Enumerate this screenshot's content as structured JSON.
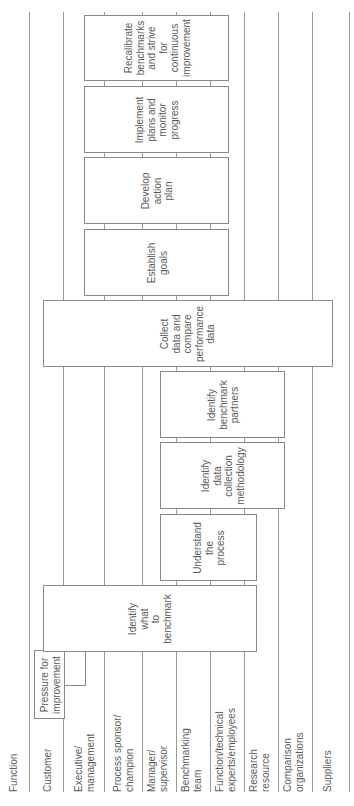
{
  "diagram": {
    "orientation": "rotated-90-ccw",
    "header_label": "Function",
    "lanes": [
      {
        "label": "Customer"
      },
      {
        "label": "Executive/\nmanagement"
      },
      {
        "label": "Process sponsor/\nchampion"
      },
      {
        "label": "Manager/\nsupervisor"
      },
      {
        "label": "Benchmarking\nteam"
      },
      {
        "label": "Function/technical\nexperts/employees"
      },
      {
        "label": "Research\nresource"
      },
      {
        "label": "Comparison\norganizations"
      },
      {
        "label": "Suppliers"
      }
    ],
    "trigger": {
      "label": "Pressure for\nimprovement"
    },
    "steps": [
      {
        "label": "Identify\nwhat\nto\nbenchmark"
      },
      {
        "label": "Understand\nthe\nprocess"
      },
      {
        "label": "Identify\ndata\ncollection\nmethodology"
      },
      {
        "label": "Identify\nbenchmark\npartners"
      },
      {
        "label": "Collect\ndata and\ncompare\nperformance\ndata"
      },
      {
        "label": "Establish\ngoals"
      },
      {
        "label": "Develop\naction\nplan"
      },
      {
        "label": "Implement\nplans and\nmonitor\nprogress"
      },
      {
        "label": "Recalibrate\nbenchmarks\nand strive\nfor\ncontinuous\nimprovement"
      }
    ],
    "colors": {
      "line": "#9a9a9a",
      "box_border": "#8a8a8a",
      "text": "#5a5a5a",
      "background": "#ffffff"
    }
  }
}
